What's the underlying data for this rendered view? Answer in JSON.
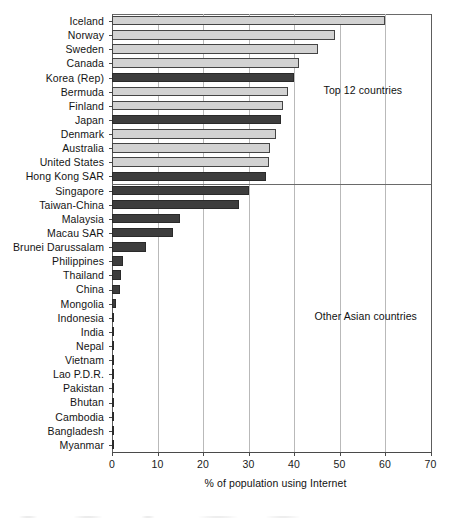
{
  "chart_data": {
    "type": "bar",
    "orientation": "horizontal",
    "title": "",
    "xlabel": "% of population using Internet",
    "ylabel": "",
    "xlim": [
      0,
      70
    ],
    "xticks": [
      0,
      10,
      20,
      30,
      40,
      50,
      60,
      70
    ],
    "grid": true,
    "legend": null,
    "categories": [
      "Iceland",
      "Norway",
      "Sweden",
      "Canada",
      "Korea (Rep)",
      "Bermuda",
      "Finland",
      "Japan",
      "Denmark",
      "Australia",
      "United States",
      "Hong Kong SAR",
      "Singapore",
      "Taiwan-China",
      "Malaysia",
      "Macau SAR",
      "Brunei Darussalam",
      "Philippines",
      "Thailand",
      "China",
      "Mongolia",
      "Indonesia",
      "India",
      "Nepal",
      "Vietnam",
      "Lao P.D.R.",
      "Pakistan",
      "Bhutan",
      "Cambodia",
      "Bangladesh",
      "Myanmar"
    ],
    "values": [
      60.0,
      49.0,
      45.2,
      41.0,
      40.0,
      38.7,
      37.5,
      37.2,
      36.0,
      34.8,
      34.5,
      33.8,
      30.1,
      28.0,
      15.0,
      13.4,
      7.5,
      2.4,
      2.0,
      1.7,
      0.8,
      0.4,
      0.4,
      0.3,
      0.3,
      0.3,
      0.3,
      0.05,
      0.05,
      0.05,
      0.05
    ],
    "series_group": [
      "light",
      "light",
      "light",
      "light",
      "dark",
      "light",
      "light",
      "dark",
      "light",
      "light",
      "light",
      "dark",
      "dark",
      "dark",
      "dark",
      "dark",
      "dark",
      "dark",
      "dark",
      "dark",
      "dark",
      "dark",
      "dark",
      "dark",
      "dark",
      "dark",
      "dark",
      "dark",
      "dark",
      "dark",
      "dark"
    ],
    "colors": {
      "light_bar": "#d2d2d2",
      "dark_bar": "#3d3d3d",
      "bar_edge": "#3a3a3a",
      "gridline": "#b9b9b9",
      "axis": "#4a4a4a",
      "text": "#141414"
    },
    "annotations": [
      {
        "text": "Top 12 countries",
        "x_pct": 46.5,
        "row_index": 5
      },
      {
        "text": "Other Asian countries",
        "x_pct": 44.5,
        "row_index": 21
      }
    ],
    "group_divider_after_index": 11
  }
}
